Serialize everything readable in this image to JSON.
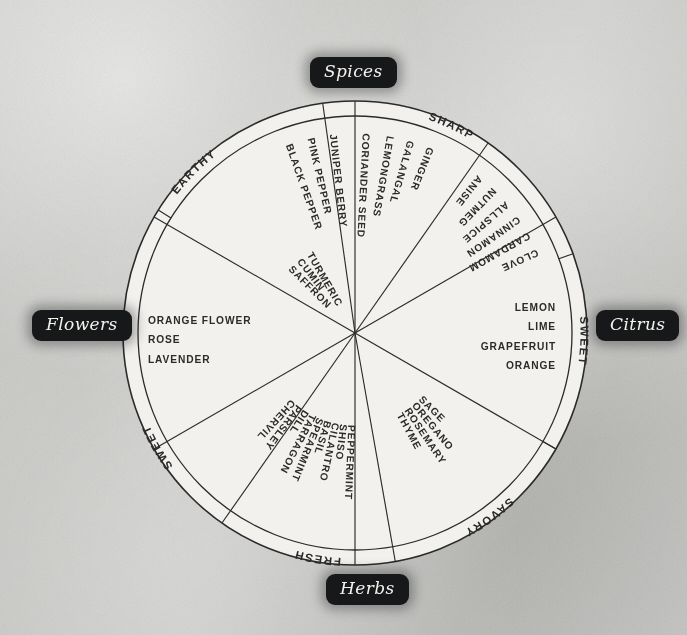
{
  "diagram": {
    "type": "radial-category-wheel",
    "background_color": "#c9cac7",
    "ink_color": "#2b2b2b",
    "wheel_fill": "#f2f1ee",
    "badge_color": "#17181a",
    "badge_text_color": "#f4f2ee",
    "center": {
      "x": 355,
      "y": 333
    },
    "radius_outer": 232,
    "radius_inner": 217
  },
  "badges": [
    {
      "id": "spices",
      "label": "Spices",
      "position": "top"
    },
    {
      "id": "flowers",
      "label": "Flowers",
      "position": "left"
    },
    {
      "id": "citrus",
      "label": "Citrus",
      "position": "right"
    },
    {
      "id": "herbs",
      "label": "Herbs",
      "position": "bottom"
    }
  ],
  "sectors": [
    {
      "id": "earthy",
      "ring_label": "EARTHY",
      "group": "Spices",
      "start_angle": 212,
      "end_angle": 262,
      "label_angle": 238,
      "item_orientation": "radial",
      "items": [
        "SAFFRON",
        "CUMIN",
        "TURMERIC"
      ]
    },
    {
      "id": "fresh",
      "ring_label": "FRESH",
      "group": "Spices",
      "start_angle": 262,
      "end_angle": 305,
      "label_angle": 284,
      "item_orientation": "radial",
      "items": [
        "GINGER",
        "GALANGAL",
        "LEMONGRASS",
        "CORIANDER SEED"
      ]
    },
    {
      "id": "sharp",
      "ring_label": "SHARP",
      "group": "Spices",
      "start_angle": 305,
      "end_angle": 340,
      "label_angle": 289,
      "item_orientation": "radial",
      "items": [
        "BLACK PEPPER",
        "PINK PEPPER",
        "JUNIPER BERRY"
      ]
    },
    {
      "id": "sweet-spice",
      "ring_label": "SWEET",
      "group": "Spices",
      "start_angle": 340,
      "end_angle": 30,
      "label_angle": 30,
      "item_orientation": "radial",
      "items": [
        "ANISE",
        "NUTMEG",
        "ALLSPICE",
        "CINNAMON",
        "CARDAMOM",
        "CLOVE"
      ]
    },
    {
      "id": "citrus",
      "ring_label": "",
      "group": "Citrus",
      "start_angle": 330,
      "end_angle": 30,
      "label_angle": 0,
      "item_orientation": "horizontal-right",
      "items": [
        "LEMON",
        "LIME",
        "GRAPEFRUIT",
        "ORANGE"
      ]
    },
    {
      "id": "flowers",
      "ring_label": "",
      "group": "Flowers",
      "start_angle": 150,
      "end_angle": 210,
      "label_angle": 180,
      "item_orientation": "horizontal-left",
      "items": [
        "ORANGE FLOWER",
        "ROSE",
        "LAVENDER"
      ]
    },
    {
      "id": "sweet-herb",
      "ring_label": "SWEET",
      "group": "Herbs",
      "start_angle": 125,
      "end_angle": 180,
      "label_angle": 152,
      "item_orientation": "radial",
      "items": [
        "CHERVIL",
        "PARSLEY",
        "DILL",
        "TARRAGON",
        "SPEARMINT",
        "BASIL",
        "CILANTRO",
        "SHISO",
        "PEPPERMINT"
      ]
    },
    {
      "id": "savory",
      "ring_label": "SAVORY",
      "group": "Herbs",
      "start_angle": 30,
      "end_angle": 80,
      "label_angle": 56,
      "item_orientation": "radial",
      "items": [
        "THYME",
        "ROSEMARY",
        "OREGANO",
        "SAGE"
      ]
    }
  ]
}
